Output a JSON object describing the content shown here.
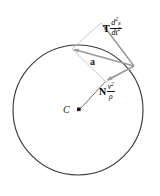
{
  "figure": {
    "center_label": "C",
    "resultant_label": "a",
    "tangential": {
      "unit_vector": "T",
      "numerator": "d",
      "numerator_exp": "2",
      "numerator_var": "s",
      "denominator": "dt",
      "denominator_exp": "2"
    },
    "normal": {
      "unit_vector": "N",
      "numerator": "v",
      "numerator_exp": "2",
      "denominator": "ρ"
    },
    "colors": {
      "circle": "#3a3a3a",
      "vector": "#9a9a9a",
      "construction": "#b8b8b8",
      "text": "#1a1a1a",
      "background": "#ffffff"
    },
    "geometry": {
      "circle_center_x": 78,
      "circle_center_y": 110,
      "circle_radius": 65,
      "point_x": 72,
      "point_y": 49
    }
  }
}
